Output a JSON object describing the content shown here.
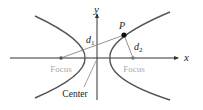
{
  "diagram": {
    "axes": {
      "x_label": "x",
      "y_label": "y"
    },
    "labels": {
      "point": "P",
      "distance1": "d",
      "distance1_sub": "1",
      "distance2": "d",
      "distance2_sub": "2",
      "focus_left": "Focus",
      "focus_right": "Focus",
      "center": "Center"
    },
    "colors": {
      "curve": "#555555",
      "axis": "#333333",
      "focus_text": "#a8a8a8",
      "text": "#222222",
      "segment": "#777777"
    }
  }
}
